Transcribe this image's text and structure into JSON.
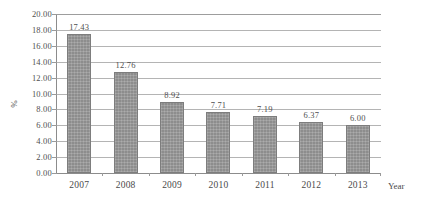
{
  "chart_data": {
    "type": "bar",
    "title": "",
    "subtitle": "",
    "xlabel": "Year",
    "ylabel": "%",
    "categories": [
      "2007",
      "2008",
      "2009",
      "2010",
      "2011",
      "2012",
      "2013"
    ],
    "values": [
      17.43,
      12.76,
      8.92,
      7.71,
      7.19,
      6.37,
      6.0
    ],
    "data_labels": [
      "17.43",
      "12.76",
      "8.92",
      "7.71",
      "7.19",
      "6.37",
      "6.00"
    ],
    "ylim": [
      0,
      20
    ],
    "ytick_step": 2,
    "ytick_labels": [
      "20.00",
      "18.00",
      "16.00",
      "14.00",
      "12.00",
      "10.00",
      "8.00",
      "6.00",
      "4.00",
      "2.00",
      "0.00"
    ],
    "ytick_values": [
      20,
      18,
      16,
      14,
      12,
      10,
      8,
      6,
      4,
      2,
      0
    ],
    "grid": "horizontal",
    "legend": "none",
    "series": [
      {
        "name": "",
        "values": [
          17.43,
          12.76,
          8.92,
          7.71,
          7.19,
          6.37,
          6.0
        ],
        "color": "#8d8d8d"
      }
    ],
    "colors": {
      "bar_fill": "#8d8d8d",
      "bar_border": "#7d7d7d",
      "gridline": "#b4b4b4",
      "axis_line": "#8c8c8c",
      "text": "#4a4a4a",
      "background": "#ffffff"
    }
  }
}
